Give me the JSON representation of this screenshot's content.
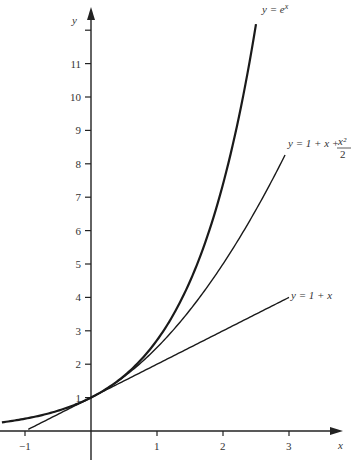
{
  "chart_data": {
    "type": "line",
    "title": "",
    "xlabel": "x",
    "ylabel": "y",
    "xlim": [
      -1.35,
      3.9
    ],
    "ylim": [
      -0.2,
      12.6
    ],
    "grid": false,
    "legend": "inline labels at curve ends",
    "x_ticks": [
      -1,
      1,
      2,
      3
    ],
    "x_tick_labels": [
      "−1",
      "1",
      "2",
      "3"
    ],
    "y_ticks": [
      1,
      2,
      3,
      4,
      5,
      6,
      7,
      8,
      9,
      10,
      11,
      12
    ],
    "y_tick_labels": [
      "1",
      "2",
      "3",
      "4",
      "5",
      "6",
      "7",
      "8",
      "9",
      "10",
      "11",
      ""
    ],
    "series": [
      {
        "name": "y = e^x",
        "label": "y = e",
        "label_sup": "x",
        "function": "exp(x)",
        "x_range": [
          -1.35,
          2.5
        ],
        "stroke_width": 2.2
      },
      {
        "name": "y = 1 + x + x^2/2",
        "label": "y = 1 + x + ",
        "label_num": "x²",
        "label_den": "2",
        "function": "1 + x + x^2/2",
        "x_range": [
          -0.25,
          2.94
        ],
        "stroke_width": 1.4
      },
      {
        "name": "y = 1 + x",
        "label": "y = 1 + x",
        "function": "1 + x",
        "x_range": [
          -0.95,
          3.0
        ],
        "stroke_width": 1.4
      }
    ]
  }
}
